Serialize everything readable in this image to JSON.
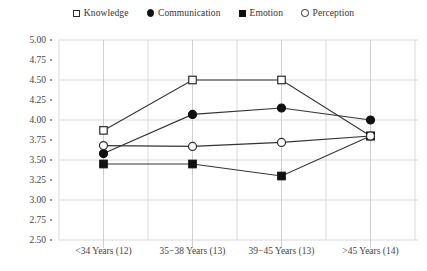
{
  "legend": {
    "position": "top-center",
    "entries": [
      {
        "label": "Knowledge",
        "marker": "open-square"
      },
      {
        "label": "Communication",
        "marker": "filled-circle"
      },
      {
        "label": "Emotion",
        "marker": "filled-square"
      },
      {
        "label": "Perception",
        "marker": "open-circle"
      }
    ]
  },
  "axes": {
    "y_ticks": [
      "5.00",
      "4.75",
      "4.50",
      "4.25",
      "4.00",
      "3.75",
      "3.50",
      "3.25",
      "3.00",
      "2.75",
      "2.50"
    ],
    "x_ticks": [
      "<34 Years (12)",
      "35−38 Years (13)",
      "39−45 Years (13)",
      ">45 Years (14)"
    ]
  },
  "colors": {
    "marker_fill": "#111111",
    "marker_open": "#ffffff",
    "marker_stroke": "#2b2b2b",
    "line": "#333333",
    "gridline": "#d9d9d9",
    "text": "#3a3a3a",
    "background": "#ffffff"
  },
  "chart_data": {
    "type": "line",
    "title": "",
    "xlabel": "",
    "ylabel": "",
    "ylim": [
      2.5,
      5.0
    ],
    "ytick_step": 0.25,
    "grid": true,
    "grid_interval": 0.5,
    "legend_position": "top-center",
    "categories": [
      "<34 Years (12)",
      "35−38 Years (13)",
      "39−45 Years (13)",
      ">45 Years (14)"
    ],
    "series": [
      {
        "name": "Knowledge",
        "marker": "open-square",
        "values": [
          3.87,
          4.5,
          4.5,
          3.8
        ]
      },
      {
        "name": "Communication",
        "marker": "filled-circle",
        "values": [
          3.58,
          4.07,
          4.15,
          4.0
        ]
      },
      {
        "name": "Emotion",
        "marker": "filled-square",
        "values": [
          3.45,
          3.45,
          3.3,
          3.8
        ]
      },
      {
        "name": "Perception",
        "marker": "open-circle",
        "values": [
          3.68,
          3.67,
          3.72,
          3.8
        ]
      }
    ]
  }
}
